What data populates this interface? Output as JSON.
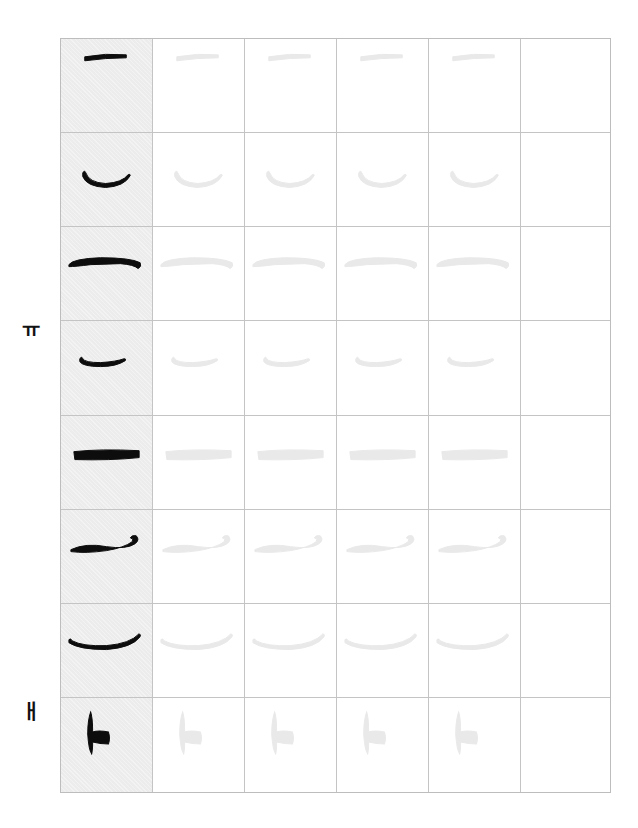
{
  "sheet": {
    "title": "Korean calligraphy vowel stroke practice sheet",
    "columns": 6,
    "rows": 8,
    "model_column_background": "#ececec",
    "ink_color": "#0d0d0d",
    "trace_color": "#e9e9e9",
    "grid_line_color": "#c4c4c4"
  },
  "side_labels": [
    {
      "text": "ㅠ",
      "row": 4
    },
    {
      "text": "ㅐ",
      "row": 8
    }
  ],
  "rows": [
    {
      "index": 1,
      "stroke": "ㄱ-like hook (horizontal + slanted down stroke)",
      "traces": 4
    },
    {
      "index": 2,
      "stroke": "curved horizontal with short drop",
      "traces": 4
    },
    {
      "index": 3,
      "stroke": "long horizontal with short drop",
      "traces": 4
    },
    {
      "index": 4,
      "stroke": "curved horizontal with two drops (ㅠ)",
      "traces": 4
    },
    {
      "index": 5,
      "stroke": "horizontal bar with two dots",
      "traces": 4
    },
    {
      "index": 6,
      "stroke": "curled horizontal with two verticals",
      "traces": 4
    },
    {
      "index": 7,
      "stroke": "shallow curve with two drops",
      "traces": 4
    },
    {
      "index": 8,
      "stroke": "ㅐ vertical pair with short tick",
      "traces": 4
    }
  ]
}
